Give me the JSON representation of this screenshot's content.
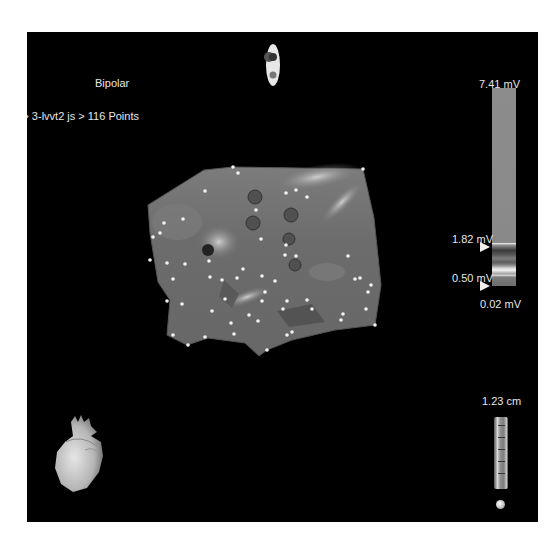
{
  "window": {
    "map_type": "Bipolar",
    "map_name": "3-lvvt2 js > 116 Points"
  },
  "colorbar": {
    "max_label": "7.41 mV",
    "upper_threshold_label": "1.82 mV",
    "lower_threshold_label": "0.50 mV",
    "min_label": "0.02 mV",
    "max_value_mv": 7.41,
    "upper_threshold_mv": 1.82,
    "lower_threshold_mv": 0.5,
    "min_value_mv": 0.02
  },
  "scale": {
    "label": "1.23 cm",
    "value_cm": 1.23
  },
  "map": {
    "point_count": 116,
    "icons": {
      "orientation": "orientation-indicator-icon",
      "heart": "heart-orientation-icon",
      "scale_ball": "scale-ball-icon"
    },
    "colors": {
      "background": "#000000",
      "surface": "#6f6f6f",
      "points": "#f2f2f2",
      "text": "#e6e6e6"
    }
  }
}
